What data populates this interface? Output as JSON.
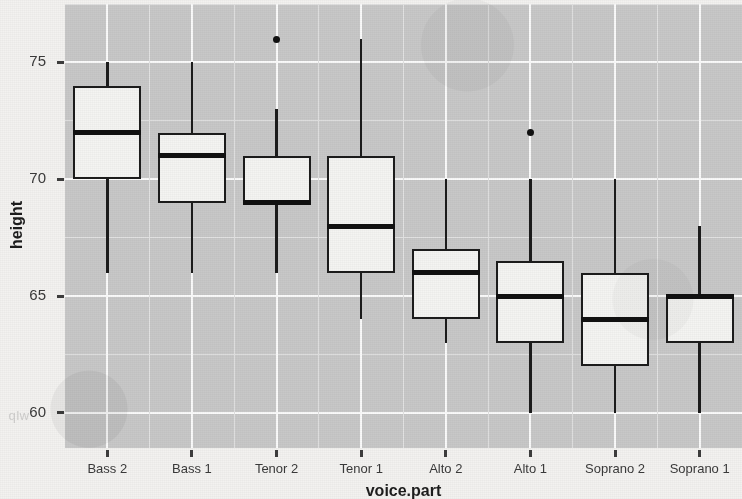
{
  "figure": {
    "width": 742,
    "height": 499,
    "panel_bg": "#c8c8c8",
    "page_bg": "#f3f2f0",
    "ink": "#1c1c1c"
  },
  "bleed_text": [
    {
      "text": "wlp",
      "x": 8,
      "y": 408
    },
    {
      "text": "orgo",
      "x": 690,
      "y": 160
    }
  ],
  "axis": {
    "y_title": "height",
    "x_title": "voice.part",
    "y_ticks": [
      "75",
      "70",
      "65",
      "60"
    ],
    "x_ticks": [
      "Bass 2",
      "Bass 1",
      "Tenor 2",
      "Tenor 1",
      "Alto 2",
      "Alto 1",
      "Soprano 2",
      "Soprano 1"
    ]
  },
  "chart_data": {
    "type": "boxplot",
    "title": "",
    "subtitle": "",
    "xlabel": "voice.part",
    "ylabel": "height",
    "categories": [
      "Bass 2",
      "Bass 1",
      "Tenor 2",
      "Tenor 1",
      "Alto 2",
      "Alto 1",
      "Soprano 2",
      "Soprano 1"
    ],
    "ylim": [
      58.5,
      77.5
    ],
    "y_tick_values": [
      75,
      70,
      65,
      60
    ],
    "y_minor_tick_values": [
      77.5,
      72.5,
      67.5,
      62.5
    ],
    "grid": "major and minor horizontal and vertical, white on grey panel",
    "legend": "none",
    "boxes": [
      {
        "category": "Bass 2",
        "lower_whisker": 66,
        "q1": 70,
        "median": 72,
        "q3": 74,
        "upper_whisker": 75,
        "outliers": []
      },
      {
        "category": "Bass 1",
        "lower_whisker": 66,
        "q1": 69,
        "median": 71,
        "q3": 72,
        "upper_whisker": 75,
        "outliers": []
      },
      {
        "category": "Tenor 2",
        "lower_whisker": 66,
        "q1": 69,
        "median": 69,
        "q3": 71,
        "upper_whisker": 73,
        "outliers": [
          76
        ]
      },
      {
        "category": "Tenor 1",
        "lower_whisker": 64,
        "q1": 66,
        "median": 68,
        "q3": 71,
        "upper_whisker": 76,
        "outliers": []
      },
      {
        "category": "Alto 2",
        "lower_whisker": 63,
        "q1": 64,
        "median": 66,
        "q3": 67,
        "upper_whisker": 70,
        "outliers": []
      },
      {
        "category": "Alto 1",
        "lower_whisker": 60,
        "q1": 63,
        "median": 65,
        "q3": 66.5,
        "upper_whisker": 70,
        "outliers": [
          72
        ]
      },
      {
        "category": "Soprano 2",
        "lower_whisker": 60,
        "q1": 62,
        "median": 64,
        "q3": 66,
        "upper_whisker": 70,
        "outliers": []
      },
      {
        "category": "Soprano 1",
        "lower_whisker": 60,
        "q1": 63,
        "median": 65,
        "q3": 65,
        "upper_whisker": 68,
        "outliers": []
      }
    ]
  }
}
